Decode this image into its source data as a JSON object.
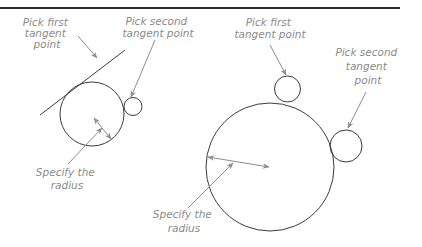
{
  "figure": {
    "type": "diagram",
    "colors": {
      "shape_stroke": "#3a3a3a",
      "leader_stroke": "#8c8c8c",
      "label_text": "#8a8a8a",
      "top_rule": "#2a2a2a"
    }
  },
  "left_example": {
    "label_first_tangent": [
      "Pick first",
      "tangent",
      "point"
    ],
    "label_second_tangent": [
      "Pick second",
      "tangent point"
    ],
    "label_radius": [
      "Specify the",
      "radius"
    ],
    "objects": [
      "tangent line",
      "large circle",
      "small circle"
    ]
  },
  "right_example": {
    "label_first_tangent": [
      "Pick first",
      "tangent point"
    ],
    "label_second_tangent": [
      "Pick second",
      "tangent",
      "point"
    ],
    "label_radius": [
      "Specify the",
      "radius"
    ],
    "objects": [
      "large circle",
      "top small circle",
      "right small circle"
    ]
  }
}
